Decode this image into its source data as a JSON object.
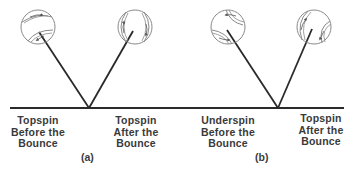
{
  "figure": {
    "colors": {
      "ink": "#2a2a2a",
      "ball_outline": "#8a8a8a",
      "text": "#3a3a3a",
      "background": "#ffffff"
    },
    "ground": {
      "y": 108,
      "x_start": 10,
      "x_end": 344
    },
    "panels": [
      {
        "tag": "(a)",
        "bounce_x": 89,
        "before": {
          "spin": "topspin",
          "label_lines": [
            "Topspin",
            "Before the",
            "Bounce"
          ],
          "ball": {
            "cx": 38,
            "cy": 27,
            "r": 17
          }
        },
        "after": {
          "spin": "topspin",
          "label_lines": [
            "Topspin",
            "After the",
            "Bounce"
          ],
          "ball": {
            "cx": 135,
            "cy": 27,
            "r": 17
          }
        }
      },
      {
        "tag": "(b)",
        "bounce_x": 278,
        "before": {
          "spin": "underspin",
          "label_lines": [
            "Underspin",
            "Before the",
            "Bounce"
          ],
          "ball": {
            "cx": 228,
            "cy": 27,
            "r": 17
          }
        },
        "after": {
          "spin": "topspin",
          "label_lines": [
            "Topspin",
            "After the",
            "Bounce"
          ],
          "ball": {
            "cx": 314,
            "cy": 27,
            "r": 17
          }
        }
      }
    ]
  }
}
